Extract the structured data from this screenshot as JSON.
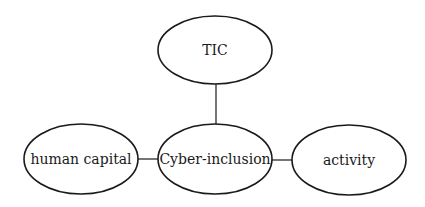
{
  "diagram": {
    "type": "concept-map",
    "nodes": [
      {
        "id": "tic",
        "label": "TIC",
        "cx": 215,
        "cy": 50,
        "rx": 57,
        "ry": 34
      },
      {
        "id": "human_capital",
        "label": "human capital",
        "cx": 81,
        "cy": 159,
        "rx": 57,
        "ry": 35
      },
      {
        "id": "cyber_inclusion",
        "label": "Cyber-inclusion",
        "cx": 215,
        "cy": 159,
        "rx": 57,
        "ry": 35
      },
      {
        "id": "activity",
        "label": "activity",
        "cx": 349,
        "cy": 160,
        "rx": 57,
        "ry": 35
      }
    ],
    "edges": [
      {
        "from": "tic",
        "to": "cyber_inclusion",
        "x1": 216,
        "y1": 84,
        "x2": 216,
        "y2": 124
      },
      {
        "from": "human_capital",
        "to": "cyber_inclusion",
        "x1": 138,
        "y1": 159,
        "x2": 158,
        "y2": 159
      },
      {
        "from": "cyber_inclusion",
        "to": "activity",
        "x1": 272,
        "y1": 160,
        "x2": 292,
        "y2": 160
      }
    ],
    "colors": {
      "stroke": "#1a1a1a",
      "fill": "#ffffff",
      "text": "#1a1a1a",
      "background": "#ffffff"
    }
  }
}
